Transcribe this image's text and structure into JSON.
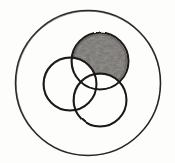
{
  "figure": {
    "title": "Three overlapping circles inside an outer circle with one region shaded",
    "style": "hand-drawn pencil sketch",
    "background_color": "#fdfdfc",
    "ink_color": "#1c1a19",
    "shading_color": "#6f6c68",
    "shading_description": "graphite pencil hatching texture"
  },
  "chart_data": {
    "type": "diagram",
    "subtype": "venn-diagram",
    "title": "Three overlapping circles inside an outer circle with one region shaded",
    "canvas": {
      "width": 175,
      "height": 163
    },
    "shapes": [
      {
        "name": "universal-set-circle",
        "role": "outer-boundary",
        "cx": 88,
        "cy": 83,
        "r": 72,
        "stroke": "#1c1a19",
        "stroke_width": 1.6,
        "fill": "none",
        "shaded": false
      },
      {
        "name": "top-circle",
        "role": "set-a",
        "cx": 100,
        "cy": 61,
        "r": 28,
        "stroke": "#1c1a19",
        "stroke_width": 2.0,
        "fill": "shaded",
        "shaded": true,
        "shaded_region": "set-a minus (set-b union set-c)"
      },
      {
        "name": "left-circle",
        "role": "set-b",
        "cx": 70,
        "cy": 84,
        "r": 26,
        "stroke": "#1c1a19",
        "stroke_width": 2.0,
        "fill": "none",
        "shaded": false
      },
      {
        "name": "bottom-right-circle",
        "role": "set-c",
        "cx": 100,
        "cy": 100,
        "r": 26,
        "stroke": "#1c1a19",
        "stroke_width": 2.0,
        "fill": "none",
        "shaded": false
      }
    ],
    "legend": [],
    "labels": [],
    "annotations": []
  }
}
